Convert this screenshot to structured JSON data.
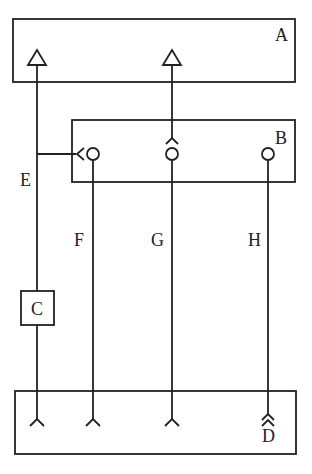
{
  "diagram": {
    "type": "block-wiring-schematic",
    "colors": {
      "line": "#222222",
      "background": "#ffffff"
    },
    "blocks": [
      {
        "id": "A",
        "label": "A"
      },
      {
        "id": "B",
        "label": "B"
      },
      {
        "id": "C",
        "label": "C"
      },
      {
        "id": "D",
        "label": "D"
      }
    ],
    "wires": [
      {
        "id": "E",
        "label": "E"
      },
      {
        "id": "F",
        "label": "F"
      },
      {
        "id": "G",
        "label": "G"
      },
      {
        "id": "H",
        "label": "H"
      }
    ]
  }
}
